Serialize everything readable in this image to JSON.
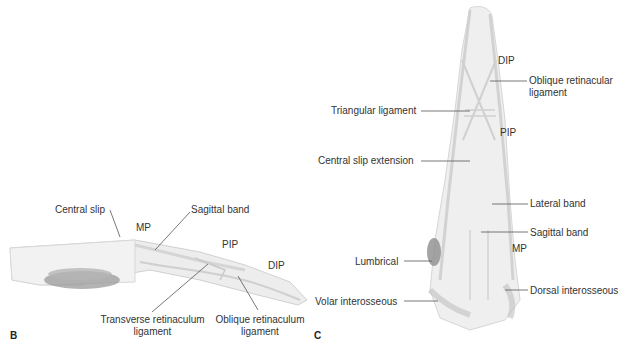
{
  "panels": {
    "b": {
      "letter": "B",
      "view": "lateral",
      "labels": {
        "central_slip": "Central slip",
        "mp": "MP",
        "sagittal_band": "Sagittal band",
        "pip": "PIP",
        "dip": "DIP",
        "transverse_line1": "Transverse retinaculum",
        "transverse_line2": "ligament",
        "oblique_line1": "Oblique retinaculum",
        "oblique_line2": "ligament"
      }
    },
    "c": {
      "letter": "C",
      "view": "dorsal",
      "labels": {
        "dip": "DIP",
        "oblique_line1": "Oblique retinacular",
        "oblique_line2": "ligament",
        "triangular": "Triangular ligament",
        "pip": "PIP",
        "central_slip_ext": "Central slip extension",
        "lateral_band": "Lateral band",
        "sagittal_band": "Sagittal band",
        "mp": "MP",
        "lumbrical": "Lumbrical",
        "dorsal_interosseous": "Dorsal interosseous",
        "volar_interosseous": "Volar interosseous"
      }
    }
  },
  "colors": {
    "leader": "#555555",
    "tissue": "#e6e6e6",
    "tissue_dark": "#8a8a8a"
  }
}
